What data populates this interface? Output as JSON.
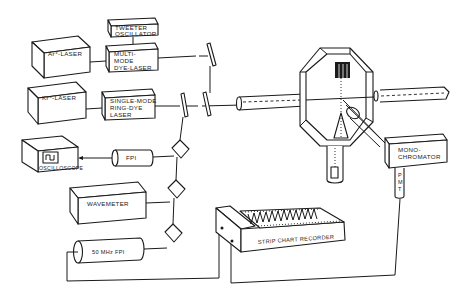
{
  "diagram": {
    "type": "experimental-setup",
    "components": {
      "ar_laser": {
        "label": "Ar⁺-LASER"
      },
      "kr_laser": {
        "label": "Kr⁺-LASER"
      },
      "tweeter": {
        "line1": "TWEETER",
        "line2": "OSCILLATOR"
      },
      "multimode_dye": {
        "line1": "MULTI-",
        "line2": "MODE",
        "line3": "DYE-LASER"
      },
      "ring_dye": {
        "line1": "SINGLE-MODE",
        "line2": "RING-DYE",
        "line3": "LASER"
      },
      "oscilloscope": {
        "label": "OSCILLOSCOPE"
      },
      "fpi": {
        "label": "FPI"
      },
      "wavemeter": {
        "label": "WAVEMETER"
      },
      "fpi_50mhz": {
        "label": "50 MHz FPI"
      },
      "monochromator": {
        "line1": "MONO-",
        "line2": "CHROMATOR"
      },
      "pmt": {
        "l1": "P",
        "l2": "M",
        "l3": "T"
      },
      "strip_chart": {
        "label": "STRIP CHART RECORDER"
      },
      "chamber": {
        "label": ""
      }
    },
    "connections": [
      "ar_laser -> multimode_dye",
      "tweeter -> multimode_dye",
      "kr_laser -> ring_dye",
      "multimode_dye -> mirror -> chamber",
      "ring_dye -> beamsplitter -> chamber",
      "beamsplitter -> fpi -> oscilloscope",
      "beamsplitter -> wavemeter",
      "beamsplitter -> fpi_50mhz",
      "fpi_50mhz -> strip_chart",
      "chamber -> monochromator -> pmt -> strip_chart"
    ]
  }
}
